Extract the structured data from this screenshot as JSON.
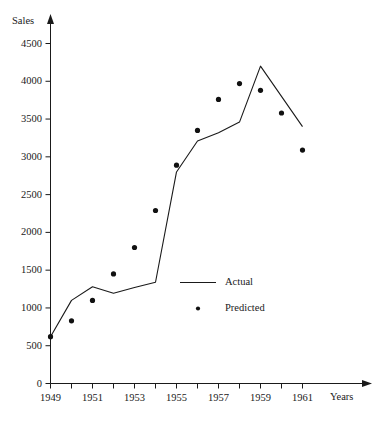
{
  "chart_data": {
    "type": "line",
    "title": "",
    "xlabel": "Years",
    "ylabel": "Sales",
    "xlim": [
      1949,
      1962
    ],
    "ylim": [
      0,
      4750
    ],
    "grid": false,
    "legend_position": "inside-center-right",
    "x": [
      1949,
      1950,
      1951,
      1952,
      1953,
      1954,
      1955,
      1956,
      1957,
      1958,
      1959,
      1960,
      1961
    ],
    "x_tick_labels": [
      "1949",
      "",
      "1951",
      "",
      "1953",
      "",
      "1955",
      "",
      "1957",
      "",
      "1959",
      "",
      "1961"
    ],
    "y_tick_labels": [
      "0",
      "500",
      "1000",
      "1500",
      "2000",
      "2500",
      "3000",
      "3500",
      "4000",
      "4500"
    ],
    "y_tick_values": [
      0,
      500,
      1000,
      1500,
      2000,
      2500,
      3000,
      3500,
      4000,
      4500
    ],
    "series": [
      {
        "name": "Actual",
        "marker": "line",
        "values": [
          620,
          1100,
          1280,
          1195,
          1270,
          1340,
          2800,
          3210,
          3320,
          3460,
          4200,
          3800,
          3400
        ]
      },
      {
        "name": "Predicted",
        "marker": "dot",
        "values": [
          620,
          830,
          1100,
          1450,
          1800,
          2290,
          2890,
          3350,
          3760,
          3970,
          3880,
          3580,
          3090
        ]
      }
    ]
  },
  "legend": {
    "entries": [
      {
        "label": "Actual",
        "marker": "line"
      },
      {
        "label": "Predicted",
        "marker": "dot"
      }
    ]
  },
  "axes": {
    "y_axis_title": "Sales",
    "x_axis_title": "Years"
  }
}
